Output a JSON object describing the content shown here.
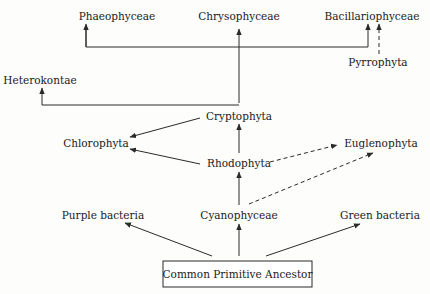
{
  "diagram": {
    "title": "",
    "nodes": {
      "phaeophyceae": "Phaeophyceae",
      "chrysophyceae": "Chrysophyceae",
      "bacillariophyceae": "Bacillariophyceae",
      "pyrrophyta": "Pyrrophyta",
      "heterokontae": "Heterokontae",
      "cryptophyta": "Cryptophyta",
      "chlorophyta": "Chlorophyta",
      "rhodophyta": "Rhodophyta",
      "euglenophyta": "Euglenophyta",
      "purple_bacteria": "Purple bacteria",
      "cyanophyceae": "Cyanophyceae",
      "green_bacteria": "Green bacteria",
      "ancestor": "Common Primitive Ancestor"
    },
    "edges": [
      {
        "from": "Common Primitive Ancestor",
        "to": "Purple bacteria",
        "style": "solid"
      },
      {
        "from": "Common Primitive Ancestor",
        "to": "Cyanophyceae",
        "style": "solid"
      },
      {
        "from": "Common Primitive Ancestor",
        "to": "Green bacteria",
        "style": "solid"
      },
      {
        "from": "Cyanophyceae",
        "to": "Rhodophyta",
        "style": "solid"
      },
      {
        "from": "Cyanophyceae",
        "to": "Euglenophyta",
        "style": "dashed"
      },
      {
        "from": "Rhodophyta",
        "to": "Cryptophyta",
        "style": "solid"
      },
      {
        "from": "Rhodophyta",
        "to": "Chlorophyta",
        "style": "solid"
      },
      {
        "from": "Rhodophyta",
        "to": "Euglenophyta",
        "style": "dashed"
      },
      {
        "from": "Cryptophyta",
        "to": "Chlorophyta",
        "style": "solid"
      },
      {
        "from": "Cryptophyta",
        "to": "Heterokontae",
        "style": "solid"
      },
      {
        "from": "Cryptophyta",
        "to": "Chrysophyceae",
        "style": "solid"
      },
      {
        "from": "Cryptophyta",
        "to": "Phaeophyceae",
        "style": "solid"
      },
      {
        "from": "Cryptophyta",
        "to": "Bacillariophyceae",
        "style": "solid"
      },
      {
        "from": "Pyrrophyta",
        "to": "Bacillariophyceae",
        "style": "dashed"
      }
    ]
  }
}
